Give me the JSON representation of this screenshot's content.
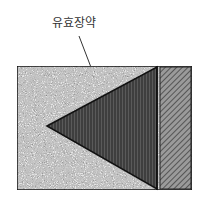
{
  "diagram": {
    "label": "유효장약",
    "colors": {
      "outer_fill": "#d8d8d8",
      "triangle_fill": "#4a4a4a",
      "strip_fill": "#8a8a8a",
      "outline": "#1a1a1a"
    }
  }
}
